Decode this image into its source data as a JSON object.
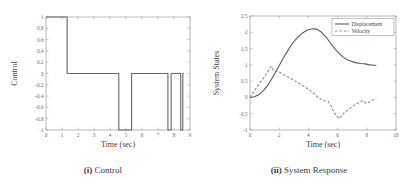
{
  "figure": {
    "panels": [
      {
        "id": "control",
        "caption_prefix": "(i)",
        "caption_text": "Control"
      },
      {
        "id": "system-response",
        "caption_prefix": "(ii)",
        "caption_text": "System Response"
      }
    ]
  },
  "chart_data": [
    {
      "type": "line",
      "id": "control",
      "title": "",
      "xlabel": "Time (sec)",
      "ylabel": "Control",
      "xlim": [
        0,
        9
      ],
      "ylim": [
        -1,
        1
      ],
      "xticks": [
        0,
        1,
        2,
        3,
        4,
        5,
        6,
        7,
        8,
        9
      ],
      "xticklabels": [
        "0",
        "1",
        "2",
        "3",
        "4",
        "5",
        "6",
        "7",
        "8",
        "9"
      ],
      "yticks": [
        -1,
        -0.8,
        -0.6,
        -0.4,
        -0.2,
        0,
        0.2,
        0.4,
        0.6,
        0.8,
        1
      ],
      "yticklabels": [
        "-1",
        "-0.8",
        "-0.6",
        "-0.4",
        "-0.2",
        "0",
        "0.2",
        "0.4",
        "0.6",
        "0.8",
        "1"
      ],
      "grid": false,
      "legend": null,
      "series": [
        {
          "name": "Control",
          "style": "solid",
          "color": "#666666",
          "x": [
            0.0,
            1.32,
            1.32,
            4.55,
            4.55,
            5.35,
            5.35,
            7.62,
            7.62,
            7.82,
            7.82,
            8.42,
            8.42,
            8.55,
            8.55,
            8.62
          ],
          "y": [
            1.0,
            1.0,
            0.0,
            0.0,
            -1.0,
            -1.0,
            0.0,
            0.0,
            -1.0,
            -1.0,
            0.0,
            0.0,
            -1.0,
            -1.0,
            0.0,
            0.0
          ]
        }
      ]
    },
    {
      "type": "line",
      "id": "system-response",
      "title": "",
      "xlabel": "Time (sec)",
      "ylabel": "System States",
      "xlim": [
        0,
        10
      ],
      "ylim": [
        -1,
        2.5
      ],
      "xticks": [
        0,
        2,
        4,
        6,
        8,
        10
      ],
      "xticklabels": [
        "0",
        "2",
        "4",
        "6",
        "8",
        "10"
      ],
      "yticks": [
        -1,
        -0.5,
        0,
        0.5,
        1,
        1.5,
        2,
        2.5
      ],
      "yticklabels": [
        "-1",
        "-0.5",
        "0",
        "0.5",
        "1",
        "1.5",
        "2",
        "2.5"
      ],
      "grid": false,
      "legend": {
        "position": "top-right",
        "entries": [
          {
            "label": "Displacement",
            "style": "solid"
          },
          {
            "label": "Velocity",
            "style": "dashed"
          }
        ]
      },
      "series": [
        {
          "name": "Displacement",
          "style": "solid",
          "color": "#5a5a5a",
          "x": [
            0.0,
            0.3,
            0.6,
            0.9,
            1.2,
            1.5,
            1.8,
            2.1,
            2.4,
            2.7,
            3.0,
            3.3,
            3.6,
            3.9,
            4.2,
            4.4,
            4.6,
            4.9,
            5.2,
            5.5,
            5.8,
            6.1,
            6.4,
            6.7,
            7.0,
            7.3,
            7.6,
            7.9,
            8.2,
            8.5,
            8.65
          ],
          "y": [
            0.0,
            0.02,
            0.08,
            0.2,
            0.36,
            0.58,
            0.82,
            1.06,
            1.3,
            1.52,
            1.71,
            1.86,
            1.98,
            2.06,
            2.1,
            2.11,
            2.09,
            2.0,
            1.86,
            1.68,
            1.5,
            1.35,
            1.23,
            1.15,
            1.1,
            1.06,
            1.04,
            1.03,
            1.0,
            0.99,
            0.99
          ]
        },
        {
          "name": "Velocity",
          "style": "dashed",
          "color": "#8a8a8a",
          "x": [
            0.0,
            0.3,
            0.6,
            0.9,
            1.2,
            1.45,
            1.65,
            1.9,
            2.2,
            2.5,
            2.8,
            3.1,
            3.4,
            3.7,
            4.0,
            4.3,
            4.6,
            4.9,
            5.1,
            5.35,
            5.6,
            5.8,
            6.1,
            6.4,
            6.7,
            7.0,
            7.3,
            7.55,
            7.75,
            7.95,
            8.2,
            8.45,
            8.65
          ],
          "y": [
            0.0,
            0.2,
            0.4,
            0.58,
            0.78,
            0.95,
            0.8,
            0.8,
            0.73,
            0.65,
            0.58,
            0.5,
            0.42,
            0.34,
            0.25,
            0.15,
            0.02,
            -0.06,
            -0.1,
            -0.12,
            -0.3,
            -0.5,
            -0.65,
            -0.5,
            -0.38,
            -0.28,
            -0.2,
            -0.13,
            -0.1,
            -0.18,
            -0.14,
            -0.07,
            -0.05
          ]
        }
      ]
    }
  ]
}
